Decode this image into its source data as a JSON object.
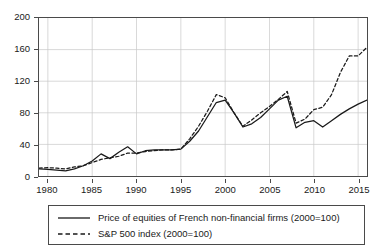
{
  "chart_data": {
    "type": "line",
    "title": "",
    "xlabel": "",
    "ylabel": "",
    "xlim": [
      1979,
      2016
    ],
    "ylim": [
      0,
      200
    ],
    "ytick_values": [
      0,
      40,
      80,
      120,
      160,
      200
    ],
    "ytick_labels": [
      "0",
      "40",
      "80",
      "120",
      "160",
      "200"
    ],
    "xtick_values": [
      1980,
      1985,
      1990,
      1995,
      2000,
      2005,
      2010,
      2015
    ],
    "xtick_labels": [
      "1980",
      "1985",
      "1990",
      "1995",
      "2000",
      "2005",
      "2010",
      "2015"
    ],
    "grid": true,
    "legend_position": "below-plot",
    "x": [
      1979,
      1980,
      1981,
      1982,
      1983,
      1984,
      1985,
      1986,
      1987,
      1988,
      1989,
      1990,
      1991,
      1992,
      1993,
      1994,
      1995,
      1996,
      1997,
      1998,
      1999,
      2000,
      2001,
      2002,
      2003,
      2004,
      2005,
      2006,
      2007,
      2008,
      2009,
      2010,
      2011,
      2012,
      2013,
      2014,
      2015,
      2016
    ],
    "series": [
      {
        "name": "Price of equities of French non-financial firms (2000=100)",
        "style": "solid",
        "color": "#1a1a1a",
        "values": [
          9,
          8.5,
          7.5,
          6.5,
          9,
          13,
          19,
          28,
          22,
          30,
          37,
          28,
          32,
          33,
          33,
          33,
          34,
          44,
          57,
          75,
          93,
          96,
          80,
          62,
          66,
          74,
          85,
          96,
          101,
          61,
          68,
          70,
          62,
          70,
          78,
          85,
          91,
          96
        ]
      },
      {
        "name": "S&P 500 index (2000=100)",
        "style": "dashed",
        "color": "#1a1a1a",
        "values": [
          10,
          10.5,
          10,
          9,
          11.5,
          13,
          17,
          21,
          23,
          25,
          29,
          29,
          31,
          32,
          33,
          33,
          34,
          47,
          63,
          82,
          103,
          99,
          80,
          63,
          71,
          80,
          88,
          97,
          107,
          67,
          72,
          84,
          87,
          103,
          131,
          152,
          152,
          163
        ]
      }
    ]
  },
  "legend": {
    "entries": [
      {
        "label": "Price of equities of French non-financial firms (2000=100)",
        "style": "solid"
      },
      {
        "label": "S&P 500 index (2000=100)",
        "style": "dashed"
      }
    ]
  }
}
